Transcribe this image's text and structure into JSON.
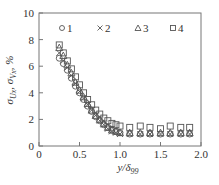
{
  "chart_data": {
    "type": "scatter",
    "title": "",
    "xlabel": "y/δ99",
    "ylabel": "σUx, σVx, %",
    "xlim": [
      0,
      2.0
    ],
    "ylim": [
      0,
      10
    ],
    "xticks": [
      "0",
      "0.5",
      "1.0",
      "1.5",
      "2.0"
    ],
    "yticks": [
      "0",
      "2",
      "4",
      "6",
      "8",
      "10"
    ],
    "grid": false,
    "legend_position": "top inside",
    "series": [
      {
        "name": "1",
        "marker": "circle",
        "x": [
          0.25,
          0.3,
          0.35,
          0.4,
          0.45,
          0.5,
          0.55,
          0.6,
          0.65,
          0.7,
          0.75,
          0.8,
          0.85,
          0.9,
          0.95,
          1.0,
          1.12,
          1.25,
          1.37,
          1.5,
          1.62,
          1.75,
          1.86
        ],
        "y": [
          6.6,
          6.2,
          5.7,
          5.1,
          4.5,
          4.0,
          3.5,
          3.0,
          2.6,
          2.2,
          1.9,
          1.6,
          1.4,
          1.2,
          1.1,
          1.0,
          0.9,
          0.9,
          0.9,
          0.9,
          0.9,
          0.9,
          0.9
        ]
      },
      {
        "name": "2",
        "marker": "cross",
        "x": [
          0.25,
          0.3,
          0.35,
          0.4,
          0.45,
          0.5,
          0.55,
          0.6,
          0.65,
          0.7,
          0.75,
          0.8,
          0.85,
          0.9,
          0.95,
          1.0,
          1.12,
          1.25,
          1.37,
          1.5,
          1.62,
          1.75,
          1.86
        ],
        "y": [
          7.0,
          6.4,
          5.9,
          5.3,
          4.7,
          4.1,
          3.6,
          3.1,
          2.7,
          2.3,
          1.9,
          1.6,
          1.3,
          1.1,
          1.0,
          0.9,
          0.9,
          0.9,
          0.9,
          0.9,
          0.9,
          0.9,
          0.9
        ]
      },
      {
        "name": "3",
        "marker": "triangle",
        "x": [
          0.25,
          0.3,
          0.35,
          0.4,
          0.45,
          0.5,
          0.55,
          0.6,
          0.65,
          0.7,
          0.75,
          0.8,
          0.85,
          0.9,
          0.95,
          1.0,
          1.12,
          1.25,
          1.37,
          1.5,
          1.62,
          1.75,
          1.86
        ],
        "y": [
          7.4,
          6.8,
          6.1,
          5.5,
          4.8,
          4.2,
          3.7,
          3.2,
          2.7,
          2.3,
          2.0,
          1.7,
          1.4,
          1.2,
          1.1,
          1.0,
          1.0,
          1.0,
          1.0,
          1.0,
          1.0,
          1.0,
          1.0
        ]
      },
      {
        "name": "4",
        "marker": "square",
        "x": [
          0.25,
          0.3,
          0.35,
          0.4,
          0.45,
          0.5,
          0.55,
          0.6,
          0.65,
          0.7,
          0.75,
          0.8,
          0.85,
          0.9,
          0.95,
          1.0,
          1.12,
          1.25,
          1.37,
          1.5,
          1.62,
          1.75,
          1.86
        ],
        "y": [
          7.6,
          7.0,
          6.4,
          5.8,
          5.2,
          4.6,
          4.0,
          3.5,
          3.1,
          2.7,
          2.4,
          2.1,
          1.9,
          1.7,
          1.6,
          1.5,
          1.4,
          1.5,
          1.4,
          1.3,
          1.5,
          1.4,
          1.4
        ]
      }
    ]
  },
  "legend": {
    "items": [
      {
        "symbol": "○",
        "label": "1"
      },
      {
        "symbol": "×",
        "label": "2"
      },
      {
        "symbol": "△",
        "label": "3"
      },
      {
        "symbol": "□",
        "label": "4"
      }
    ]
  },
  "axes": {
    "x_title_main": "y/δ",
    "x_title_sub": "99",
    "y_title": "σ",
    "y_title_full": "σUx, σVx, %"
  }
}
